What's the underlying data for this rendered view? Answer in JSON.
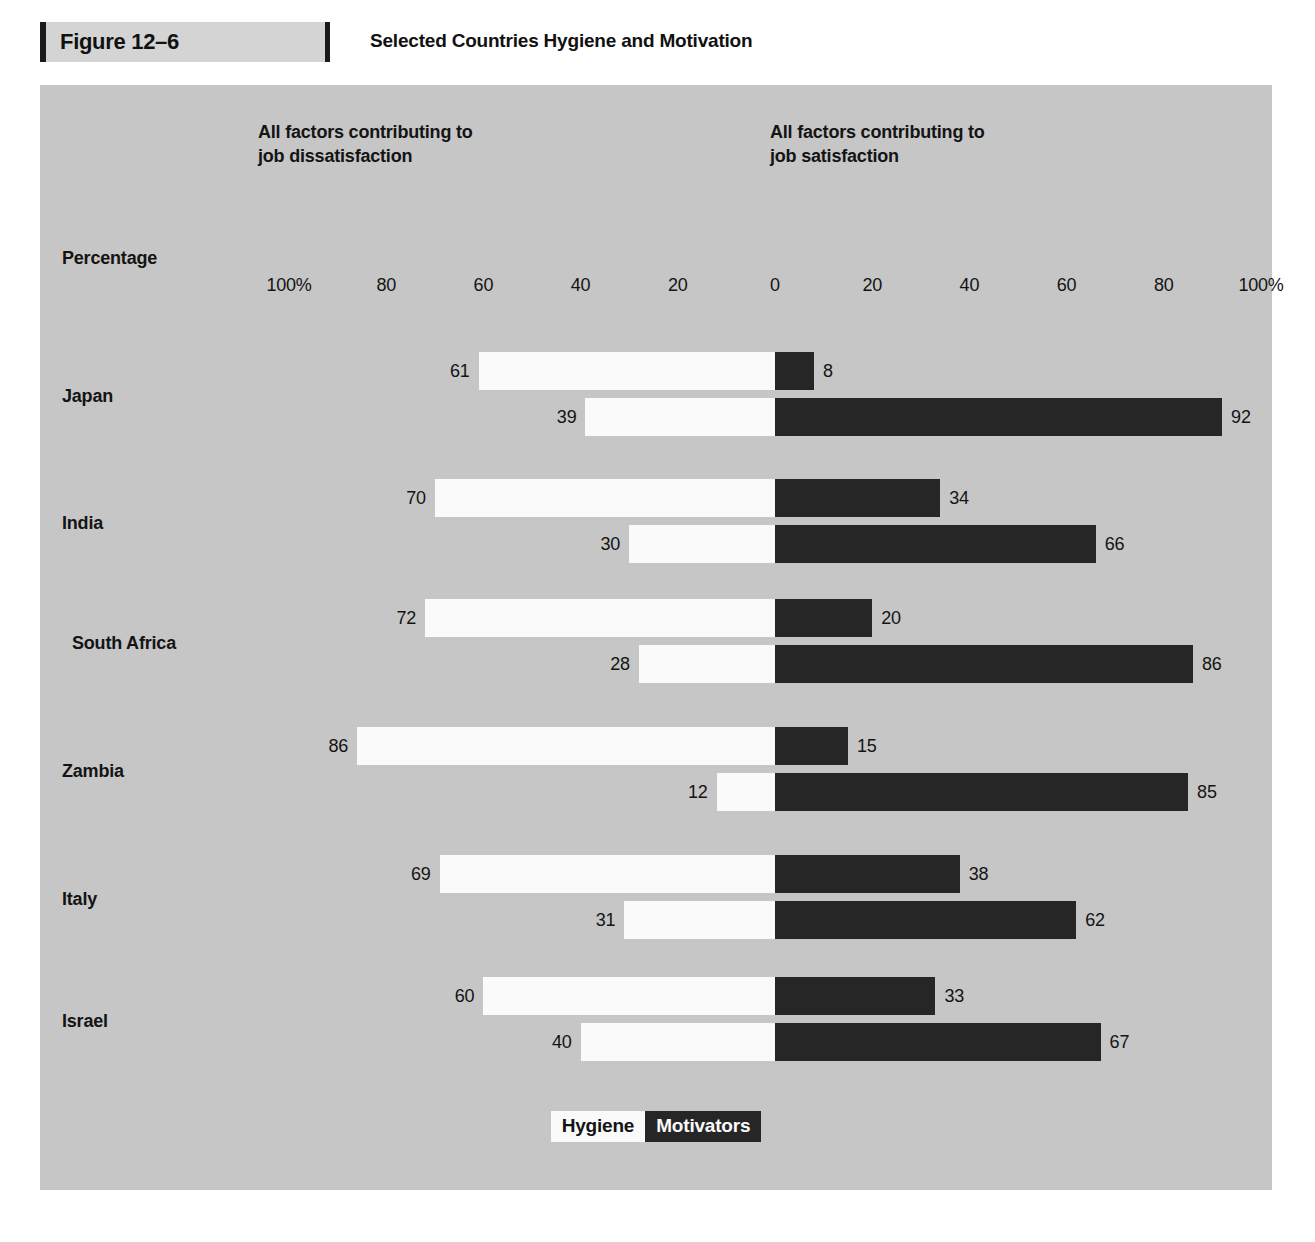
{
  "figure": {
    "number_label": "Figure 12–6",
    "title": "Selected Countries Hygiene and Motivation"
  },
  "headers": {
    "left": "All factors contributing to\njob dissatisfaction",
    "right": "All factors contributing to\njob satisfaction",
    "axis_title": "Percentage"
  },
  "legend": {
    "hygiene": "Hygiene",
    "motivators": "Motivators"
  },
  "colors": {
    "panel_background": "#c6c6c6",
    "hygiene": "#fafafa",
    "motivators": "#262626",
    "text": "#141414",
    "figure_box": "#d4d4d4",
    "page_background": "#ffffff"
  },
  "chart_data": {
    "type": "bar",
    "title": "Selected Countries Hygiene and Motivation",
    "subtype": "diverging-stacked-horizontal",
    "xlabel": "Percentage",
    "ylabel": "",
    "xlim": [
      -100,
      100
    ],
    "grid": false,
    "legend_position": "bottom-center",
    "axis_ticks": [
      {
        "label": "100%",
        "value": -100
      },
      {
        "label": "80",
        "value": -80
      },
      {
        "label": "60",
        "value": -60
      },
      {
        "label": "40",
        "value": -40
      },
      {
        "label": "20",
        "value": -20
      },
      {
        "label": "0",
        "value": 0
      },
      {
        "label": "20",
        "value": 20
      },
      {
        "label": "40",
        "value": 40
      },
      {
        "label": "60",
        "value": 60
      },
      {
        "label": "80",
        "value": 80
      },
      {
        "label": "100%",
        "value": 100
      }
    ],
    "left_group_label": "All factors contributing to job dissatisfaction",
    "right_group_label": "All factors contributing to job satisfaction",
    "series": [
      {
        "name": "Hygiene",
        "color": "#fafafa"
      },
      {
        "name": "Motivators",
        "color": "#262626"
      }
    ],
    "categories": [
      "Japan",
      "India",
      "South Africa",
      "Zambia",
      "Italy",
      "Israel"
    ],
    "groups": [
      {
        "country": "Japan",
        "indent": false,
        "rows": [
          {
            "series": "dissatisfaction",
            "left_value": 61,
            "left_series": "Hygiene",
            "right_value": 8,
            "right_series": "Motivators"
          },
          {
            "series": "satisfaction",
            "left_value": 39,
            "left_series": "Hygiene",
            "right_value": 92,
            "right_series": "Motivators"
          }
        ]
      },
      {
        "country": "India",
        "indent": false,
        "rows": [
          {
            "series": "dissatisfaction",
            "left_value": 70,
            "left_series": "Hygiene",
            "right_value": 34,
            "right_series": "Motivators"
          },
          {
            "series": "satisfaction",
            "left_value": 30,
            "left_series": "Hygiene",
            "right_value": 66,
            "right_series": "Motivators"
          }
        ]
      },
      {
        "country": "South Africa",
        "indent": true,
        "rows": [
          {
            "series": "dissatisfaction",
            "left_value": 72,
            "left_series": "Hygiene",
            "right_value": 20,
            "right_series": "Motivators"
          },
          {
            "series": "satisfaction",
            "left_value": 28,
            "left_series": "Hygiene",
            "right_value": 86,
            "right_series": "Motivators"
          }
        ]
      },
      {
        "country": "Zambia",
        "indent": false,
        "rows": [
          {
            "series": "dissatisfaction",
            "left_value": 86,
            "left_series": "Hygiene",
            "right_value": 15,
            "right_series": "Motivators"
          },
          {
            "series": "satisfaction",
            "left_value": 12,
            "left_series": "Hygiene",
            "right_value": 85,
            "right_series": "Motivators"
          }
        ]
      },
      {
        "country": "Italy",
        "indent": false,
        "rows": [
          {
            "series": "dissatisfaction",
            "left_value": 69,
            "left_series": "Hygiene",
            "right_value": 38,
            "right_series": "Motivators"
          },
          {
            "series": "satisfaction",
            "left_value": 31,
            "left_series": "Hygiene",
            "right_value": 62,
            "right_series": "Motivators"
          }
        ]
      },
      {
        "country": "Israel",
        "indent": false,
        "rows": [
          {
            "series": "dissatisfaction",
            "left_value": 60,
            "left_series": "Hygiene",
            "right_value": 33,
            "right_series": "Motivators"
          },
          {
            "series": "satisfaction",
            "left_value": 40,
            "left_series": "Hygiene",
            "right_value": 67,
            "right_series": "Motivators"
          }
        ]
      }
    ]
  },
  "geometry": {
    "zero_x": 735,
    "px_per_unit": 4.86,
    "group_tops": [
      265,
      392,
      512,
      640,
      768,
      890
    ]
  }
}
